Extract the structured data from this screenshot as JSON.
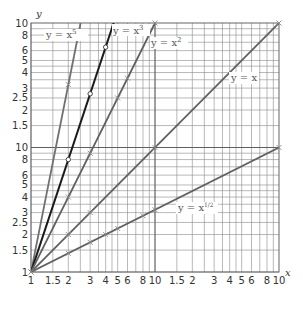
{
  "chart_data": {
    "type": "line",
    "title": "",
    "xlabel": "x",
    "ylabel": "y",
    "scale": "log-log",
    "xlim": [
      1,
      100
    ],
    "ylim": [
      1,
      100
    ],
    "grid": true,
    "legend_position": "inline labels",
    "x_tick_labels": [
      "1",
      "1.5",
      "2",
      "3",
      "4",
      "5",
      "6",
      "8",
      "10",
      "1.5",
      "2",
      "3",
      "4",
      "5",
      "6",
      "8",
      "10"
    ],
    "y_tick_labels": [
      "1",
      "1.5",
      "2",
      "2.5",
      "3",
      "4",
      "5",
      "6",
      "8",
      "10",
      "1.5",
      "2",
      "2.5",
      "3",
      "4",
      "5",
      "6",
      "8",
      "10"
    ],
    "series": [
      {
        "name": "y = x^5",
        "label": "y = x",
        "exp": "5",
        "power": 5,
        "color": "#707070",
        "x": [
          1,
          1.5849,
          2.5119
        ],
        "y": [
          1,
          10,
          100
        ],
        "markers": [
          {
            "x": 1,
            "y": 1
          },
          {
            "x": 2,
            "y": 32
          }
        ]
      },
      {
        "name": "y = x^3",
        "label": "y = x",
        "exp": "3",
        "power": 3,
        "color": "#1a1a1a",
        "x": [
          1,
          2.1544,
          4.6416
        ],
        "y": [
          1,
          10,
          100
        ],
        "markers": [
          {
            "x": 2,
            "y": 8
          },
          {
            "x": 3,
            "y": 27
          },
          {
            "x": 4,
            "y": 64
          }
        ]
      },
      {
        "name": "y = x^2",
        "label": "y = x",
        "exp": "2",
        "power": 2,
        "color": "#606060",
        "x": [
          1,
          3.1623,
          10
        ],
        "y": [
          1,
          10,
          100
        ],
        "markers": [
          {
            "x": 2,
            "y": 4
          },
          {
            "x": 3,
            "y": 9
          },
          {
            "x": 5,
            "y": 25
          },
          {
            "x": 6,
            "y": 36
          },
          {
            "x": 10,
            "y": 100
          }
        ]
      },
      {
        "name": "y = x",
        "label": "y = x",
        "exp": "",
        "power": 1,
        "color": "#606060",
        "x": [
          1,
          10,
          100
        ],
        "y": [
          1,
          10,
          100
        ],
        "markers": [
          {
            "x": 2,
            "y": 2
          },
          {
            "x": 3,
            "y": 3
          },
          {
            "x": 10,
            "y": 10
          },
          {
            "x": 100,
            "y": 100
          }
        ]
      },
      {
        "name": "y = x^1/2",
        "label": "y = x",
        "exp": "1/2",
        "power": 0.5,
        "color": "#606060",
        "x": [
          1,
          10,
          100
        ],
        "y": [
          1,
          3.1623,
          10
        ],
        "markers": [
          {
            "x": 2,
            "y": 1.414
          },
          {
            "x": 3,
            "y": 1.732
          },
          {
            "x": 4,
            "y": 2
          },
          {
            "x": 5,
            "y": 2.236
          },
          {
            "x": 8,
            "y": 2.828
          },
          {
            "x": 10,
            "y": 3.162
          },
          {
            "x": 100,
            "y": 10
          }
        ]
      }
    ]
  },
  "axes": {
    "x_name": "x",
    "y_name": "y"
  },
  "labels": {
    "x5": {
      "base": "y = x",
      "exp": "5"
    },
    "x3": {
      "base": "y = x",
      "exp": "3"
    },
    "x2": {
      "base": "y = x",
      "exp": "2"
    },
    "x1": {
      "base": "y = x",
      "exp": ""
    },
    "xhalf": {
      "base": "y = x",
      "exp": "1/2"
    }
  }
}
